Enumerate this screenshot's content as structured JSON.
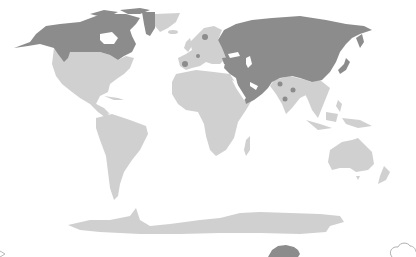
{
  "map": {
    "type": "world-choropleth",
    "projection": "robinson-like",
    "colors": {
      "background": "#ffffff",
      "highlighted": "#8c8c8c",
      "default": "#d0d0d0"
    },
    "highlighted_regions": [
      "Alaska (USA)",
      "Canada",
      "Western Greenland",
      "Russia",
      "Kazakhstan / Central Asia",
      "Mongolia",
      "China",
      "Japan",
      "Middle East / Arabian Peninsula / Iran",
      "Turkey",
      "Scandinavia (dot)",
      "Iberia (dot)",
      "Central Europe (dot)",
      "India (dots)"
    ],
    "default_regions": [
      "Contiguous USA",
      "Mexico",
      "Central America",
      "Caribbean",
      "South America",
      "Eastern Greenland",
      "Western Europe",
      "Africa",
      "Madagascar",
      "India",
      "Southeast Asia",
      "Indonesia",
      "Papua New Guinea",
      "Australia",
      "New Zealand",
      "Antarctica"
    ],
    "decorations": {
      "bottom_left": "arrow-fragment",
      "bottom_center": "dark-animal-silhouette",
      "bottom_right": "cloud-outline"
    }
  }
}
